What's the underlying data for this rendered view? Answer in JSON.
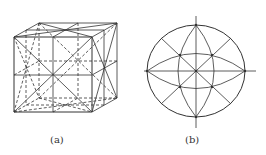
{
  "figure": {
    "panels": [
      {
        "id": "a",
        "label": "(a)",
        "description": "Cube wireframe showing symmetry axes and planes"
      },
      {
        "id": "b",
        "label": "(b)",
        "description": "Stereographic projection of cubic symmetry elements"
      }
    ],
    "colors": {
      "line": "#333333",
      "background": "#ffffff"
    }
  }
}
